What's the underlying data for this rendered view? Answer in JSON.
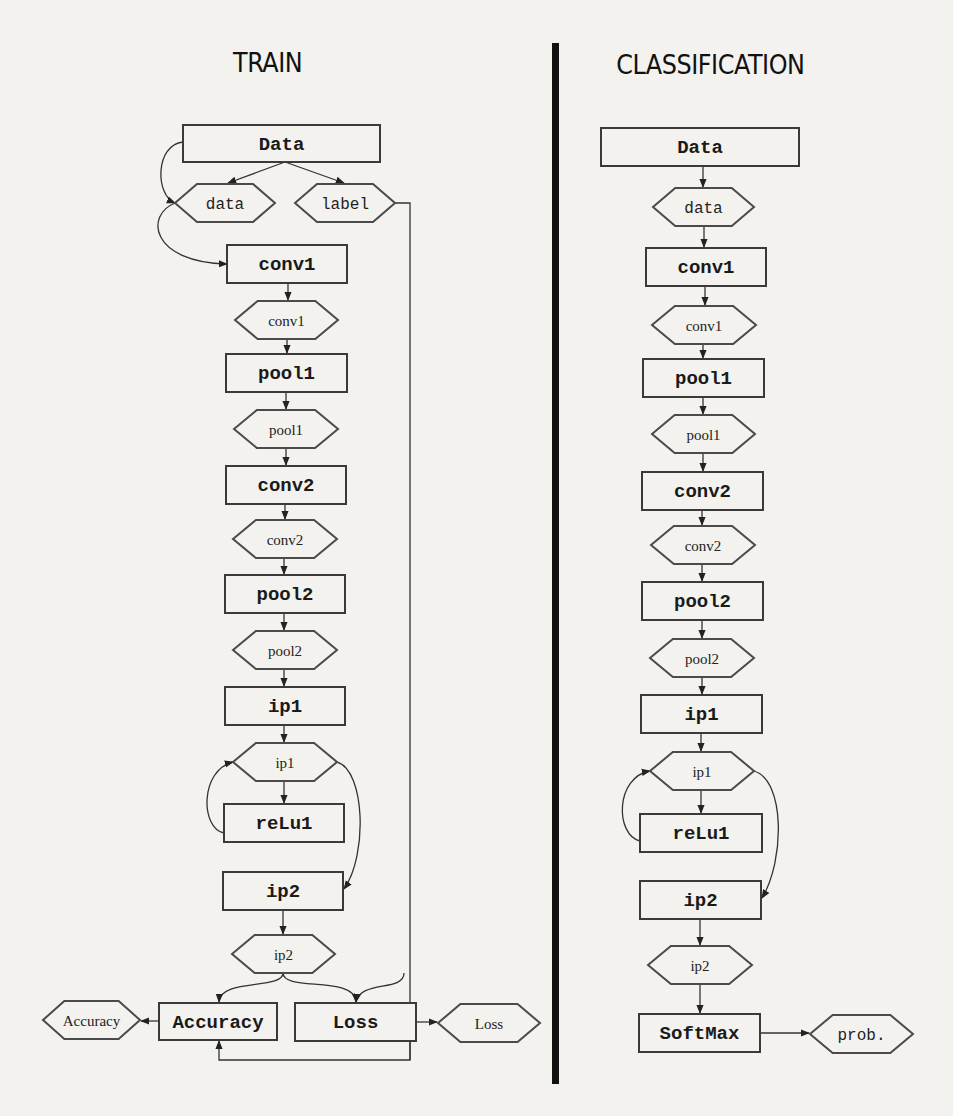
{
  "titles": {
    "train": "TRAIN",
    "classification": "CLASSIFICATION"
  },
  "train": {
    "layers": [
      {
        "id": "t_data_box",
        "kind": "box",
        "label": "Data",
        "x": 183,
        "y": 125,
        "w": 197,
        "h": 37
      },
      {
        "id": "t_data_hex",
        "kind": "hex",
        "label": "data",
        "x": 175,
        "y": 184,
        "w": 100,
        "h": 38,
        "mono": true
      },
      {
        "id": "t_label_hex",
        "kind": "hex",
        "label": "label",
        "x": 295,
        "y": 184,
        "w": 100,
        "h": 38,
        "mono": true
      },
      {
        "id": "t_conv1_box",
        "kind": "box",
        "label": "conv1",
        "x": 227,
        "y": 245,
        "w": 120,
        "h": 38
      },
      {
        "id": "t_conv1_hex",
        "kind": "hex",
        "label": "conv1",
        "x": 235,
        "y": 301,
        "w": 103,
        "h": 38
      },
      {
        "id": "t_pool1_box",
        "kind": "box",
        "label": "pool1",
        "x": 226,
        "y": 354,
        "w": 121,
        "h": 38
      },
      {
        "id": "t_pool1_hex",
        "kind": "hex",
        "label": "pool1",
        "x": 234,
        "y": 410,
        "w": 104,
        "h": 38
      },
      {
        "id": "t_conv2_box",
        "kind": "box",
        "label": "conv2",
        "x": 226,
        "y": 466,
        "w": 120,
        "h": 38
      },
      {
        "id": "t_conv2_hex",
        "kind": "hex",
        "label": "conv2",
        "x": 233,
        "y": 520,
        "w": 104,
        "h": 38
      },
      {
        "id": "t_pool2_box",
        "kind": "box",
        "label": "pool2",
        "x": 225,
        "y": 575,
        "w": 120,
        "h": 38
      },
      {
        "id": "t_pool2_hex",
        "kind": "hex",
        "label": "pool2",
        "x": 233,
        "y": 631,
        "w": 104,
        "h": 38
      },
      {
        "id": "t_ip1_box",
        "kind": "box",
        "label": "ip1",
        "x": 225,
        "y": 687,
        "w": 120,
        "h": 38
      },
      {
        "id": "t_ip1_hex",
        "kind": "hex",
        "label": "ip1",
        "x": 233,
        "y": 743,
        "w": 104,
        "h": 38
      },
      {
        "id": "t_relu1_box",
        "kind": "box",
        "label": "reLu1",
        "x": 224,
        "y": 804,
        "w": 120,
        "h": 38
      },
      {
        "id": "t_ip2_box",
        "kind": "box",
        "label": "ip2",
        "x": 223,
        "y": 872,
        "w": 120,
        "h": 38
      },
      {
        "id": "t_ip2_hex",
        "kind": "hex",
        "label": "ip2",
        "x": 232,
        "y": 935,
        "w": 103,
        "h": 38
      },
      {
        "id": "t_accuracy_box",
        "kind": "box",
        "label": "Accuracy",
        "x": 159,
        "y": 1003,
        "w": 118,
        "h": 37
      },
      {
        "id": "t_loss_box",
        "kind": "box",
        "label": "Loss",
        "x": 295,
        "y": 1003,
        "w": 121,
        "h": 38
      },
      {
        "id": "t_accuracy_hex",
        "kind": "hex",
        "label": "Accuracy",
        "x": 43,
        "y": 1001,
        "w": 97,
        "h": 38
      },
      {
        "id": "t_loss_hex",
        "kind": "hex",
        "label": "Loss",
        "x": 438,
        "y": 1004,
        "w": 102,
        "h": 38
      }
    ]
  },
  "classification": {
    "layers": [
      {
        "id": "c_data_box",
        "kind": "box",
        "label": "Data",
        "x": 601,
        "y": 128,
        "w": 198,
        "h": 38
      },
      {
        "id": "c_data_hex",
        "kind": "hex",
        "label": "data",
        "x": 653,
        "y": 188,
        "w": 101,
        "h": 38,
        "mono": true
      },
      {
        "id": "c_conv1_box",
        "kind": "box",
        "label": "conv1",
        "x": 646,
        "y": 248,
        "w": 120,
        "h": 38
      },
      {
        "id": "c_conv1_hex",
        "kind": "hex",
        "label": "conv1",
        "x": 652,
        "y": 306,
        "w": 104,
        "h": 38
      },
      {
        "id": "c_pool1_box",
        "kind": "box",
        "label": "pool1",
        "x": 643,
        "y": 359,
        "w": 121,
        "h": 38
      },
      {
        "id": "c_pool1_hex",
        "kind": "hex",
        "label": "pool1",
        "x": 652,
        "y": 415,
        "w": 103,
        "h": 38
      },
      {
        "id": "c_conv2_box",
        "kind": "box",
        "label": "conv2",
        "x": 642,
        "y": 472,
        "w": 121,
        "h": 38
      },
      {
        "id": "c_conv2_hex",
        "kind": "hex",
        "label": "conv2",
        "x": 651,
        "y": 526,
        "w": 104,
        "h": 38
      },
      {
        "id": "c_pool2_box",
        "kind": "box",
        "label": "pool2",
        "x": 642,
        "y": 582,
        "w": 121,
        "h": 38
      },
      {
        "id": "c_pool2_hex",
        "kind": "hex",
        "label": "pool2",
        "x": 650,
        "y": 639,
        "w": 104,
        "h": 38
      },
      {
        "id": "c_ip1_box",
        "kind": "box",
        "label": "ip1",
        "x": 641,
        "y": 695,
        "w": 121,
        "h": 38
      },
      {
        "id": "c_ip1_hex",
        "kind": "hex",
        "label": "ip1",
        "x": 650,
        "y": 752,
        "w": 104,
        "h": 38
      },
      {
        "id": "c_relu1_box",
        "kind": "box",
        "label": "reLu1",
        "x": 640,
        "y": 814,
        "w": 122,
        "h": 38
      },
      {
        "id": "c_ip2_box",
        "kind": "box",
        "label": "ip2",
        "x": 640,
        "y": 881,
        "w": 121,
        "h": 38
      },
      {
        "id": "c_ip2_hex",
        "kind": "hex",
        "label": "ip2",
        "x": 648,
        "y": 946,
        "w": 104,
        "h": 38
      },
      {
        "id": "c_softmax_box",
        "kind": "box",
        "label": "SoftMax",
        "x": 639,
        "y": 1014,
        "w": 121,
        "h": 38
      },
      {
        "id": "c_prob_hex",
        "kind": "hex",
        "label": "prob.",
        "x": 810,
        "y": 1015,
        "w": 103,
        "h": 38,
        "mono": true
      }
    ]
  },
  "edges": [
    {
      "d": "M285 162 L228 183"
    },
    {
      "d": "M285 162 L344 183"
    },
    {
      "d": "M183 142 C155 145 155 195 175 203"
    },
    {
      "d": "M175 203 C145 215 150 262 227 264"
    },
    {
      "d": "M395 203 L410 203 L410 1060"
    },
    {
      "d": "M288 283 L288 300"
    },
    {
      "d": "M287 339 L287 353"
    },
    {
      "d": "M286 392 L286 409"
    },
    {
      "d": "M286 448 L286 465"
    },
    {
      "d": "M285 504 L285 519"
    },
    {
      "d": "M284 558 L284 574"
    },
    {
      "d": "M284 613 L284 630"
    },
    {
      "d": "M284 669 L284 686"
    },
    {
      "d": "M284 725 L284 742"
    },
    {
      "d": "M284 781 L284 803"
    },
    {
      "d": "M224 833 C200 828 200 770 233 762"
    },
    {
      "d": "M337 762 C365 770 368 855 344 889"
    },
    {
      "d": "M283 910 L283 934"
    },
    {
      "d": "M283 973 C283 990 220 978 219 1002"
    },
    {
      "d": "M283 973 C283 992 355 975 356 1002"
    },
    {
      "d": "M404 973 C404 992 360 980 356 1002"
    },
    {
      "d": "M410 1041 L410 1060 L219 1060 L219 1041"
    },
    {
      "d": "M159 1021 L141 1021"
    },
    {
      "d": "M416 1022 L437 1022"
    },
    {
      "d": "M703 166 L703 187"
    },
    {
      "d": "M704 226 L704 247"
    },
    {
      "d": "M705 286 L705 305"
    },
    {
      "d": "M703 344 L703 358"
    },
    {
      "d": "M703 397 L703 414"
    },
    {
      "d": "M703 453 L703 471"
    },
    {
      "d": "M702 510 L702 525"
    },
    {
      "d": "M702 564 L702 581"
    },
    {
      "d": "M702 620 L702 638"
    },
    {
      "d": "M702 677 L702 694"
    },
    {
      "d": "M701 733 L701 751"
    },
    {
      "d": "M701 790 L701 813"
    },
    {
      "d": "M640 841 C615 835 615 777 650 771"
    },
    {
      "d": "M754 771 C785 780 785 860 762 898"
    },
    {
      "d": "M700 919 L700 945"
    },
    {
      "d": "M700 984 L700 1013"
    },
    {
      "d": "M760 1033 L809 1033"
    }
  ]
}
